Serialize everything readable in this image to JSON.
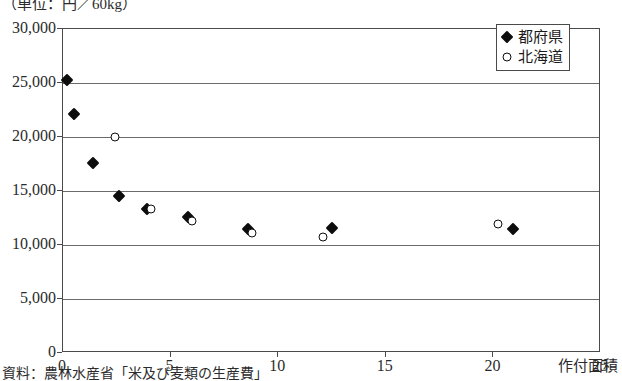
{
  "unit_caption": "（単位：円／60kg）",
  "source_note": "資料：農林水産省「米及び麦類の生産費」",
  "legend": {
    "items": [
      {
        "label": "都府県",
        "marker": "filled-diamond",
        "color": "#0d0d0d"
      },
      {
        "label": "北海道",
        "marker": "open-circle",
        "color": "#0d0d0d"
      }
    ]
  },
  "chart_data": {
    "type": "scatter",
    "title": "",
    "subtitle": "",
    "xlabel": "作付面積",
    "ylabel": "（単位：円／60kg）",
    "xlim": [
      0,
      25
    ],
    "ylim": [
      0,
      30000
    ],
    "xticks": [
      "0",
      "5",
      "10",
      "15",
      "20",
      "25"
    ],
    "xtick_values": [
      0,
      5,
      10,
      15,
      20,
      25
    ],
    "yticks": [
      "0",
      "5,000",
      "10,000",
      "15,000",
      "20,000",
      "25,000",
      "30,000"
    ],
    "ytick_values": [
      0,
      5000,
      10000,
      15000,
      20000,
      25000,
      30000
    ],
    "grid": "horizontal",
    "legend_position": "top-right",
    "series": [
      {
        "name": "都府県",
        "marker": "filled-diamond",
        "points": [
          {
            "x": 0.2,
            "y": 25300
          },
          {
            "x": 0.5,
            "y": 22100
          },
          {
            "x": 1.4,
            "y": 17600
          },
          {
            "x": 2.6,
            "y": 14500
          },
          {
            "x": 3.9,
            "y": 13300
          },
          {
            "x": 5.8,
            "y": 12600
          },
          {
            "x": 8.6,
            "y": 11500
          },
          {
            "x": 12.5,
            "y": 11600
          },
          {
            "x": 20.9,
            "y": 11500
          }
        ]
      },
      {
        "name": "北海道",
        "marker": "open-circle",
        "points": [
          {
            "x": 2.4,
            "y": 20000
          },
          {
            "x": 4.1,
            "y": 13300
          },
          {
            "x": 6.0,
            "y": 12200
          },
          {
            "x": 8.8,
            "y": 11100
          },
          {
            "x": 12.1,
            "y": 10700
          },
          {
            "x": 20.2,
            "y": 11900
          }
        ]
      }
    ]
  }
}
